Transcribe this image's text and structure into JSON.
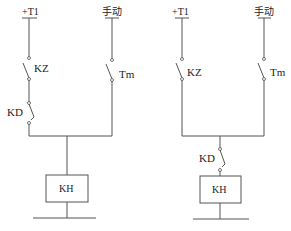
{
  "diagrams": [
    {
      "name": "circuit-a",
      "supply_label": "+T1",
      "manual_label": "手动",
      "contact_kz": "KZ",
      "contact_tm": "Tm",
      "contact_kd": "KD",
      "relay_label": "KH",
      "kd_position": "in +T1 branch, in series with KZ"
    },
    {
      "name": "circuit-b",
      "supply_label": "+T1",
      "manual_label": "手动",
      "contact_kz": "KZ",
      "contact_tm": "Tm",
      "contact_kd": "KD",
      "relay_label": "KH",
      "kd_position": "after junction, in series with KH"
    }
  ],
  "colors": {
    "line": "#555555",
    "text": "#222222",
    "background": "#ffffff"
  }
}
